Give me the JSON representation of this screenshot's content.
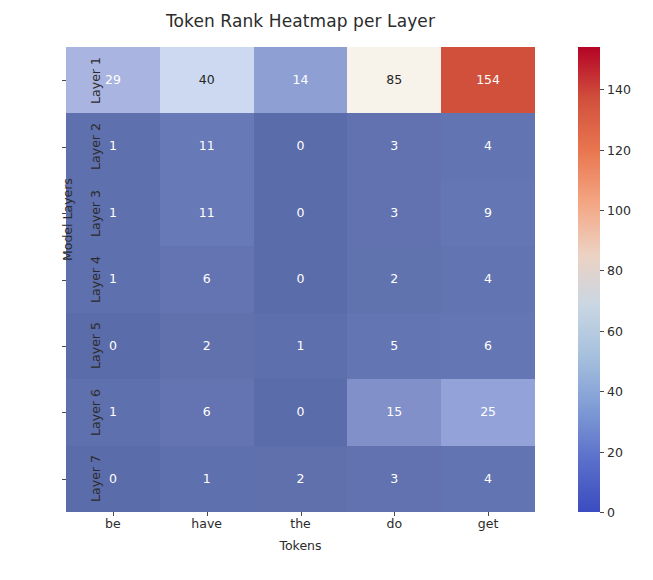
{
  "chart_data": {
    "type": "heatmap",
    "title": "Token Rank Heatmap per Layer",
    "xlabel": "Tokens",
    "ylabel": "Model Layers",
    "categories_x": [
      "be",
      "have",
      "the",
      "do",
      "get"
    ],
    "categories_y": [
      "Layer 1",
      "Layer 2",
      "Layer 3",
      "Layer 4",
      "Layer 5",
      "Layer 6",
      "Layer 7"
    ],
    "values": [
      [
        29,
        40,
        14,
        85,
        154
      ],
      [
        1,
        11,
        0,
        3,
        4
      ],
      [
        1,
        11,
        0,
        3,
        9
      ],
      [
        1,
        6,
        0,
        2,
        4
      ],
      [
        0,
        2,
        1,
        5,
        6
      ],
      [
        1,
        6,
        0,
        15,
        25
      ],
      [
        0,
        1,
        2,
        3,
        4
      ]
    ],
    "annotate": true,
    "colormap": "coolwarm",
    "vmin": 0,
    "vmax": 154,
    "grid": false,
    "colorbar": {
      "position": "right",
      "ticks": [
        0,
        20,
        40,
        60,
        80,
        100,
        120,
        140
      ],
      "ticklabels": [
        "0",
        "20",
        "40",
        "60",
        "80",
        "100",
        "120",
        "140"
      ]
    },
    "cell_colors": [
      [
        "#aab4e0",
        "#ccd9f0",
        "#8e9fd4",
        "#f7f2ea",
        "#d1503c"
      ],
      [
        "#5f70ae",
        "#6779b6",
        "#5b6caa",
        "#6272b0",
        "#6374b2"
      ],
      [
        "#5f70ae",
        "#6779b6",
        "#5b6caa",
        "#6272b0",
        "#6576b4"
      ],
      [
        "#5f70ae",
        "#6474b2",
        "#5b6caa",
        "#6173af",
        "#6374b2"
      ],
      [
        "#5b6caa",
        "#6071ae",
        "#5e6fad",
        "#6475b3",
        "#6576b4"
      ],
      [
        "#5f70ae",
        "#6474b2",
        "#5b6caa",
        "#8190c9",
        "#93a2d8"
      ],
      [
        "#5b6caa",
        "#5f70ae",
        "#6070ad",
        "#6272b0",
        "#6374b2"
      ]
    ],
    "cell_text_colors": [
      [
        "#ffffff",
        "#262626",
        "#ffffff",
        "#262626",
        "#ffffff"
      ],
      [
        "#ffffff",
        "#ffffff",
        "#ffffff",
        "#ffffff",
        "#ffffff"
      ],
      [
        "#ffffff",
        "#ffffff",
        "#ffffff",
        "#ffffff",
        "#ffffff"
      ],
      [
        "#ffffff",
        "#ffffff",
        "#ffffff",
        "#ffffff",
        "#ffffff"
      ],
      [
        "#ffffff",
        "#ffffff",
        "#ffffff",
        "#ffffff",
        "#ffffff"
      ],
      [
        "#ffffff",
        "#ffffff",
        "#ffffff",
        "#ffffff",
        "#ffffff"
      ],
      [
        "#ffffff",
        "#ffffff",
        "#ffffff",
        "#ffffff",
        "#ffffff"
      ]
    ]
  }
}
